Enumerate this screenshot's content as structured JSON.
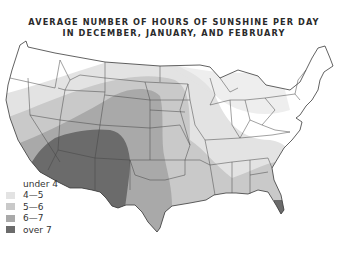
{
  "map": {
    "title_line1": "AVERAGE NUMBER OF HOURS OF SUNSHINE PER DAY",
    "title_line2": "IN DECEMBER, JANUARY, AND FEBRUARY",
    "region": "Contiguous United States",
    "legend": [
      {
        "label": "under 4",
        "color": "#ffffff"
      },
      {
        "label": "4—5",
        "color": "#e3e3e3"
      },
      {
        "label": "5—6",
        "color": "#c9c9c9"
      },
      {
        "label": "6—7",
        "color": "#a9a9a9"
      },
      {
        "label": "over 7",
        "color": "#6b6b6b"
      }
    ],
    "colors": {
      "outline": "#3a3a3a",
      "background": "#ffffff"
    }
  }
}
